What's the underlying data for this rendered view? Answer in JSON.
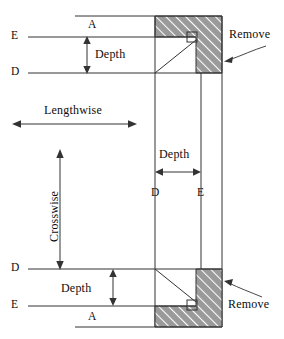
{
  "diagram": {
    "type": "engineering-cross-section",
    "colors": {
      "line": "#333333",
      "hatch_fill": "#9a9a9a",
      "hatch_stroke": "#ffffff",
      "text": "#0d0d0d",
      "background": "#ffffff"
    },
    "labels": {
      "top_a": "A",
      "top_e": "E",
      "top_d": "D",
      "top_depth": "Depth",
      "lengthwise": "Lengthwise",
      "crosswise": "Crosswise",
      "middle_depth": "Depth",
      "middle_d": "D",
      "middle_e": "E",
      "bottom_d": "D",
      "bottom_depth": "Depth",
      "bottom_e": "E",
      "bottom_a": "A",
      "remove_top": "Remove",
      "remove_bottom": "Remove"
    },
    "geometry": {
      "top_outer_y": 16,
      "top_e_y": 37,
      "top_d_y": 73,
      "bottom_d_y": 269,
      "bottom_e_y": 306,
      "bottom_outer_y": 327,
      "inner_x": 155,
      "mid_x": 201,
      "outer_x": 222,
      "left_x": 75
    },
    "dimension_arrows": [
      {
        "name": "top-depth",
        "orientation": "vertical",
        "label": "Depth"
      },
      {
        "name": "lengthwise",
        "orientation": "horizontal",
        "label": "Lengthwise"
      },
      {
        "name": "crosswise",
        "orientation": "vertical",
        "label": "Crosswise"
      },
      {
        "name": "middle-depth",
        "orientation": "horizontal",
        "label": "Depth"
      },
      {
        "name": "bottom-depth",
        "orientation": "vertical",
        "label": "Depth"
      }
    ],
    "remove_callouts": [
      {
        "name": "remove-top",
        "label": "Remove",
        "points_to": "top hatched region"
      },
      {
        "name": "remove-bottom",
        "label": "Remove",
        "points_to": "bottom hatched region"
      }
    ]
  }
}
